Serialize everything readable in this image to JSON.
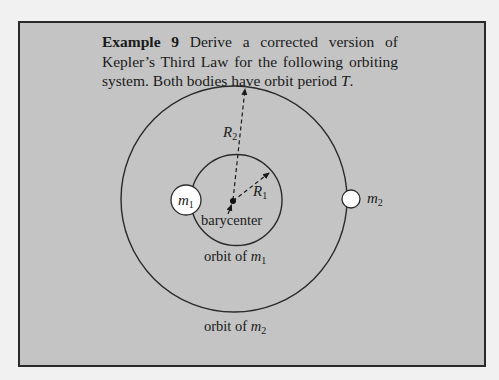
{
  "example": {
    "label": "Example 9",
    "text_part1": " Derive a corrected version of Kepler’s Third Law for the following orbiting system. Both bodies have orbit period ",
    "period_symbol": "T",
    "text_end": "."
  },
  "diagram": {
    "outer_orbit": {
      "cx": 234,
      "cy": 199,
      "r": 113
    },
    "inner_orbit": {
      "cx": 236.5,
      "cy": 200,
      "r": 45.5
    },
    "barycenter": {
      "x": 233,
      "y": 201
    },
    "body_1": {
      "name": "m",
      "subscript": "1",
      "cx": 186,
      "cy": 200,
      "r": 15
    },
    "body_2": {
      "name": "m",
      "subscript": "2",
      "cx": 351,
      "cy": 199,
      "r": 9
    },
    "radius_labels": {
      "r1": {
        "name": "R",
        "subscript": "1"
      },
      "r2": {
        "name": "R",
        "subscript": "2"
      }
    },
    "labels": {
      "barycenter": "barycenter",
      "inner_orbit_prefix": "orbit of ",
      "inner_orbit_var": "m",
      "inner_orbit_sub": "1",
      "outer_orbit_prefix": "orbit of ",
      "outer_orbit_var": "m",
      "outer_orbit_sub": "2"
    },
    "colors": {
      "box_background": "#c4c4c4",
      "page_background": "#f1f1f1",
      "line": "#2a2a2a",
      "body_fill": "#ffffff"
    }
  }
}
